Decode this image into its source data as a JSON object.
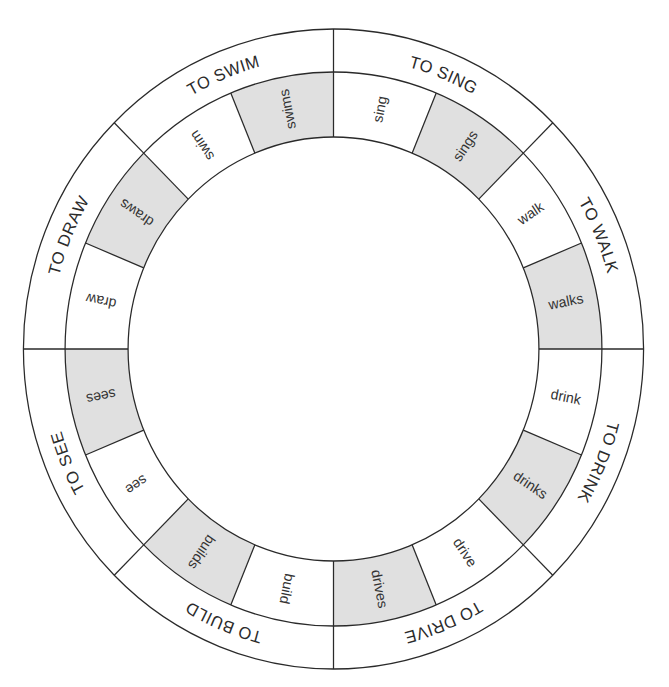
{
  "diagram": {
    "title": "",
    "colors": {
      "line": "#2a2a2a",
      "shaded_cell": "#e0e0e0",
      "plain_cell": "#ffffff",
      "text": "#333333"
    },
    "verbs": [
      {
        "label": "TO SING",
        "base": "sing",
        "third_person": "sings"
      },
      {
        "label": "TO WALK",
        "base": "walk",
        "third_person": "walks"
      },
      {
        "label": "TO DRINK",
        "base": "drink",
        "third_person": "drinks"
      },
      {
        "label": "TO DRIVE",
        "base": "drive",
        "third_person": "drives"
      },
      {
        "label": "TO BUILD",
        "base": "build",
        "third_person": "builds"
      },
      {
        "label": "TO SEE",
        "base": "see",
        "third_person": "sees"
      },
      {
        "label": "TO DRAW",
        "base": "draw",
        "third_person": "draws"
      },
      {
        "label": "TO SWIM",
        "base": "swim",
        "third_person": "swims"
      }
    ]
  }
}
